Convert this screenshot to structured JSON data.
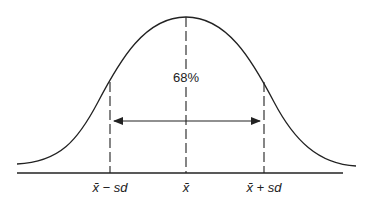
{
  "diagram": {
    "center_label": "68%",
    "axis_labels": {
      "minus_sd": "x̄ − sd",
      "mean": "x̄",
      "plus_sd": "x̄ + sd"
    },
    "colors": {
      "line": "#222222",
      "background": "#ffffff"
    },
    "arrow": {
      "type": "double-headed",
      "spans": "mean minus sd to mean plus sd"
    }
  }
}
